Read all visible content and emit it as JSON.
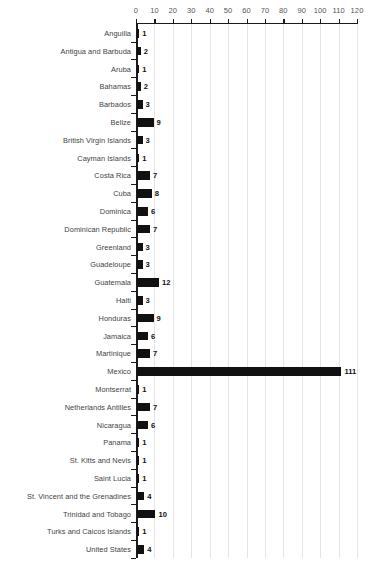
{
  "chart_data": {
    "type": "bar",
    "orientation": "horizontal",
    "title": "",
    "subtitle": "",
    "xlabel": "",
    "ylabel": "",
    "xlim": [
      0,
      120
    ],
    "xticks": [
      0,
      10,
      20,
      30,
      40,
      50,
      60,
      70,
      80,
      90,
      100,
      110,
      120
    ],
    "xtick_labels": [
      "0",
      "10",
      "20",
      "30",
      "40",
      "50",
      "60",
      "70",
      "80",
      "90",
      "100",
      "110",
      "120"
    ],
    "grid": true,
    "grid_axis": "x",
    "legend": null,
    "bar_color": "#111111",
    "grid_color": "#e4e4e4",
    "axis_color": "#1a1a1a",
    "label_color": "#3f3f3f",
    "tick_label_color": "#555555",
    "categories": [
      "Anguilla",
      "Antigua and Barbuda",
      "Aruba",
      "Bahamas",
      "Barbados",
      "Belize",
      "British Virgin Islands",
      "Cayman Islands",
      "Costa Rica",
      "Cuba",
      "Dominica",
      "Dominican Republic",
      "Greenland",
      "Guadeloupe",
      "Guatemala",
      "Haiti",
      "Honduras",
      "Jamaica",
      "Martinique",
      "Mexico",
      "Montserrat",
      "Netherlands Antilles",
      "Nicaragua",
      "Panama",
      "St. Kitts and Nevis",
      "Saint Lucia",
      "St. Vincent and the Grenadines",
      "Trinidad and Tobago",
      "Turks and Caicos Islands",
      "United States"
    ],
    "values": [
      1,
      2,
      1,
      2,
      3,
      9,
      3,
      1,
      7,
      8,
      6,
      7,
      3,
      3,
      12,
      3,
      9,
      6,
      7,
      111,
      1,
      7,
      6,
      1,
      1,
      1,
      4,
      10,
      1,
      4
    ],
    "value_labels": [
      "1",
      "2",
      "1",
      "2",
      "3",
      "9",
      "3",
      "1",
      "7",
      "8",
      "6",
      "7",
      "3",
      "3",
      "12",
      "3",
      "9",
      "6",
      "7",
      "111",
      "1",
      "7",
      "6",
      "1",
      "1",
      "1",
      "4",
      "10",
      "1",
      "4"
    ]
  },
  "caption": ""
}
